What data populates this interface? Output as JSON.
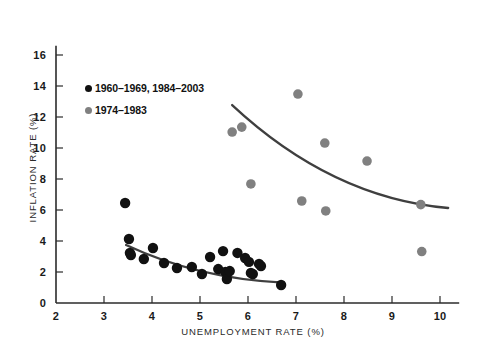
{
  "chart_data": {
    "type": "scatter",
    "title": "",
    "xlabel": "UNEMPLOYMENT RATE (%)",
    "ylabel": "INFLATION RATE (%)",
    "xlim": [
      2,
      10.4
    ],
    "ylim": [
      0,
      16.6
    ],
    "xticks": [
      2,
      3,
      4,
      5,
      6,
      7,
      8,
      9,
      10
    ],
    "yticks": [
      0,
      2,
      4,
      6,
      8,
      10,
      12,
      14,
      16
    ],
    "xtick_labels": [
      "2",
      "3",
      "4",
      "5",
      "6",
      "7",
      "8",
      "9",
      "10"
    ],
    "ytick_labels": [
      "0",
      "2",
      "4",
      "6",
      "8",
      "10",
      "12",
      "14",
      "16"
    ],
    "grid": false,
    "legend_position": "upper-left-inside",
    "series": [
      {
        "name": "1960–1969, 1984–2003",
        "marker": "circle",
        "color": "#111111",
        "marker_size": 5.2,
        "points": [
          [
            3.44,
            6.45
          ],
          [
            3.52,
            4.13
          ],
          [
            3.54,
            3.23
          ],
          [
            3.56,
            3.1
          ],
          [
            3.83,
            2.84
          ],
          [
            4.02,
            3.55
          ],
          [
            4.25,
            2.58
          ],
          [
            4.52,
            2.26
          ],
          [
            4.83,
            2.32
          ],
          [
            5.04,
            1.87
          ],
          [
            5.21,
            2.97
          ],
          [
            5.38,
            2.19
          ],
          [
            5.48,
            3.35
          ],
          [
            5.53,
            2.0
          ],
          [
            5.56,
            1.55
          ],
          [
            5.62,
            2.06
          ],
          [
            5.78,
            3.23
          ],
          [
            5.94,
            2.9
          ],
          [
            6.02,
            2.65
          ],
          [
            6.06,
            1.94
          ],
          [
            6.1,
            1.87
          ],
          [
            6.23,
            2.52
          ],
          [
            6.27,
            2.39
          ],
          [
            6.69,
            1.16
          ]
        ],
        "trend_line": {
          "type": "curve",
          "start": [
            3.46,
            3.74
          ],
          "end": [
            6.73,
            1.32
          ]
        }
      },
      {
        "name": "1974–1983",
        "marker": "circle",
        "color": "#808080",
        "marker_size": 4.8,
        "points": [
          [
            5.67,
            11.03
          ],
          [
            5.87,
            11.35
          ],
          [
            6.06,
            7.68
          ],
          [
            7.04,
            13.48
          ],
          [
            7.12,
            6.58
          ],
          [
            7.6,
            10.32
          ],
          [
            7.62,
            5.94
          ],
          [
            8.48,
            9.16
          ],
          [
            9.6,
            6.35
          ],
          [
            9.62,
            3.32
          ]
        ],
        "trend_line": {
          "type": "curve",
          "start": [
            5.67,
            12.77
          ],
          "end": [
            10.17,
            6.13
          ]
        }
      }
    ]
  },
  "legend": {
    "items": [
      {
        "label": "1960–1969, 1984–2003",
        "color": "#111111"
      },
      {
        "label": "1974–1983",
        "color": "#808080"
      }
    ]
  },
  "axes": {
    "x_title": "UNEMPLOYMENT RATE (%)",
    "y_title": "INFLATION RATE (%)"
  }
}
